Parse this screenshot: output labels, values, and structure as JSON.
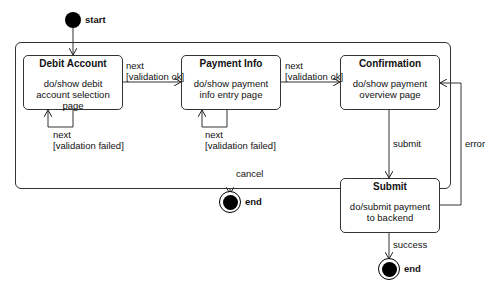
{
  "diagram": {
    "type": "UML state machine",
    "initial": {
      "label": "start"
    },
    "composite": {
      "label": ""
    },
    "states": [
      {
        "id": "debit",
        "title": "Debit Account",
        "activity": "do/show debit account selection page"
      },
      {
        "id": "payment",
        "title": "Payment Info",
        "activity": "do/show payment info entry page"
      },
      {
        "id": "confirm",
        "title": "Confirmation",
        "activity": "do/show payment overview page"
      },
      {
        "id": "submit",
        "title": "Submit",
        "activity": "do/submit payment to backend"
      }
    ],
    "finals": [
      {
        "id": "end_cancel",
        "label": "end"
      },
      {
        "id": "end_success",
        "label": "end"
      }
    ],
    "transitions": [
      {
        "from": "start",
        "to": "debit",
        "label": ""
      },
      {
        "from": "debit",
        "to": "payment",
        "label": "next\n[validation ok]"
      },
      {
        "from": "payment",
        "to": "confirm",
        "label": "next\n[validation ok]"
      },
      {
        "from": "debit",
        "to": "debit",
        "label": "next\n[validation failed]"
      },
      {
        "from": "payment",
        "to": "payment",
        "label": "next\n[validation failed]"
      },
      {
        "from": "confirm",
        "to": "submit",
        "label": "submit"
      },
      {
        "from": "submit",
        "to": "confirm",
        "label": "error"
      },
      {
        "from": "composite",
        "to": "end_cancel",
        "label": "cancel"
      },
      {
        "from": "submit",
        "to": "end_success",
        "label": "success"
      }
    ]
  }
}
